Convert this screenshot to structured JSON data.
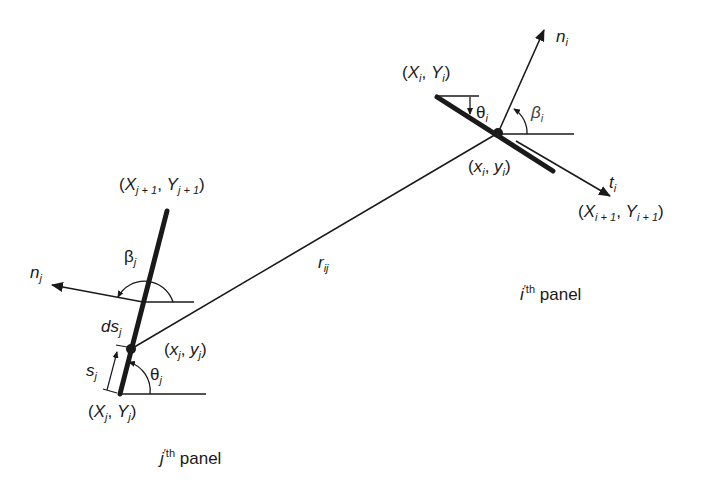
{
  "diagram": {
    "panel_i": {
      "start_label_X": "X",
      "start_label_Y": "Y",
      "start_sub": "i",
      "end_label_X": "X",
      "end_label_Y": "Y",
      "end_sub": "i + 1",
      "control_point_x": "x",
      "control_point_y": "y",
      "control_sub": "i",
      "normal": "n",
      "normal_sub": "i",
      "tangent": "t",
      "tangent_sub": "i",
      "theta": "θ",
      "theta_sub": "i",
      "beta": "β",
      "beta_sub": "i",
      "panel_name_letter": "i",
      "panel_name_sup": "th",
      "panel_name_word": "panel"
    },
    "panel_j": {
      "start_label_X": "X",
      "start_label_Y": "Y",
      "start_sub": "j",
      "end_label_X": "X",
      "end_label_Y": "Y",
      "end_sub": "j + 1",
      "point_x": "x",
      "point_y": "y",
      "point_sub": "j",
      "normal": "n",
      "normal_sub": "j",
      "theta": "θ",
      "theta_sub": "j",
      "beta": "β",
      "beta_sub": "j",
      "s": "s",
      "s_sub": "j",
      "ds": "ds",
      "ds_sub": "j",
      "panel_name_letter": "j",
      "panel_name_sup": "th",
      "panel_name_word": "panel"
    },
    "distance": {
      "label": "r",
      "sub": "ij"
    }
  }
}
